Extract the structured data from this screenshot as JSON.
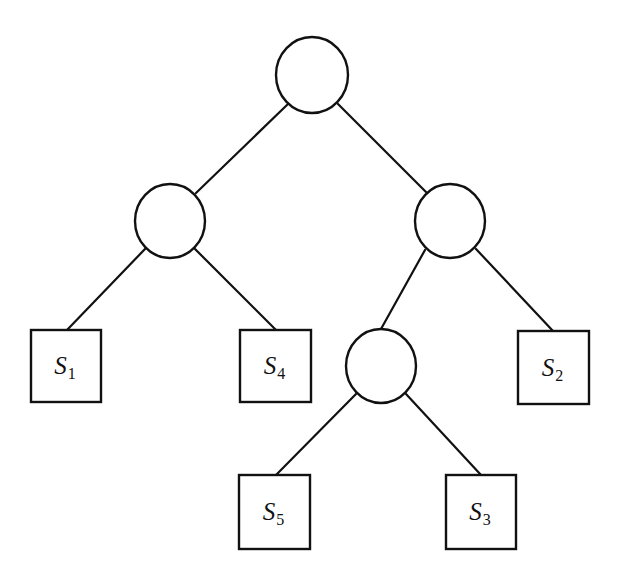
{
  "diagram": {
    "type": "binary-tree",
    "colors": {
      "stroke": "#111111",
      "background": "#ffffff"
    },
    "internal_nodes": [
      {
        "id": "root",
        "cx": 312,
        "cy": 75,
        "rx": 36,
        "ry": 38
      },
      {
        "id": "left",
        "cx": 170,
        "cy": 221,
        "rx": 35,
        "ry": 37
      },
      {
        "id": "right",
        "cx": 450,
        "cy": 221,
        "rx": 35,
        "ry": 37
      },
      {
        "id": "right-left",
        "cx": 381,
        "cy": 366,
        "rx": 35,
        "ry": 37
      }
    ],
    "leaves": [
      {
        "id": "S1",
        "label": "S",
        "subscript": "1",
        "x": 31,
        "y": 330,
        "w": 70,
        "h": 72
      },
      {
        "id": "S4",
        "label": "S",
        "subscript": "4",
        "x": 240,
        "y": 330,
        "w": 71,
        "h": 72
      },
      {
        "id": "S2",
        "label": "S",
        "subscript": "2",
        "x": 518,
        "y": 331,
        "w": 71,
        "h": 73
      },
      {
        "id": "S5",
        "label": "S",
        "subscript": "5",
        "x": 239,
        "y": 475,
        "w": 71,
        "h": 74
      },
      {
        "id": "S3",
        "label": "S",
        "subscript": "3",
        "x": 446,
        "y": 475,
        "w": 70,
        "h": 74
      }
    ],
    "edges": [
      {
        "from": "root",
        "to": "left",
        "x1": 288,
        "y1": 104,
        "x2": 196,
        "y2": 193
      },
      {
        "from": "root",
        "to": "right",
        "x1": 338,
        "y1": 104,
        "x2": 427,
        "y2": 193
      },
      {
        "from": "left",
        "to": "S1",
        "x1": 145,
        "y1": 249,
        "x2": 67,
        "y2": 330
      },
      {
        "from": "left",
        "to": "S4",
        "x1": 195,
        "y1": 249,
        "x2": 276,
        "y2": 330
      },
      {
        "from": "right",
        "to": "right-left",
        "x1": 425,
        "y1": 250,
        "x2": 381,
        "y2": 329
      },
      {
        "from": "right",
        "to": "S2",
        "x1": 476,
        "y1": 249,
        "x2": 553,
        "y2": 331
      },
      {
        "from": "right-left",
        "to": "S5",
        "x1": 356,
        "y1": 394,
        "x2": 276,
        "y2": 475
      },
      {
        "from": "right-left",
        "to": "S3",
        "x1": 406,
        "y1": 394,
        "x2": 481,
        "y2": 475
      }
    ]
  }
}
